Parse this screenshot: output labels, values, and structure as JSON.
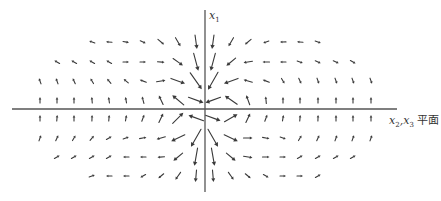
{
  "figure": {
    "colors": {
      "axis": "#555555",
      "arrow": "#3a3a3a",
      "background": "#ffffff"
    },
    "axes": {
      "vertical": {
        "x": 205,
        "y1": 10,
        "y2": 192
      },
      "horizontal": {
        "y": 109,
        "x1": 12,
        "x2": 397
      },
      "vertical_label": {
        "var": "x",
        "sub": "1",
        "x": 209,
        "y": 10
      },
      "horizontal_label": {
        "var1": "x",
        "sub1": "2",
        "sep": ",",
        "var2": "x",
        "sub2": "3",
        "suffix": "平面",
        "x": 389,
        "y": 115
      }
    },
    "columns_x": [
      40,
      57,
      74,
      92,
      109,
      126,
      143,
      161,
      178,
      196,
      213,
      231,
      248,
      266,
      283,
      300,
      318,
      336,
      353,
      371
    ],
    "rows": [
      {
        "y": 42,
        "start_col": 3,
        "angles": [
          200,
          185,
          10,
          25,
          40,
          60,
          82,
          98,
          120,
          140,
          160,
          178,
          185,
          20
        ],
        "lengths": [
          6,
          6,
          6,
          6,
          8,
          10,
          14,
          14,
          10,
          8,
          6,
          6,
          6,
          6
        ]
      },
      {
        "y": 62,
        "start_col": 1,
        "angles": [
          210,
          210,
          210,
          210,
          0,
          0,
          5,
          35,
          75,
          105,
          140,
          170,
          180,
          180,
          20,
          25,
          25,
          30
        ],
        "lengths": [
          6,
          6,
          6,
          6,
          6,
          6,
          7,
          12,
          18,
          18,
          12,
          9,
          7,
          6,
          6,
          6,
          6,
          6
        ]
      },
      {
        "y": 81,
        "start_col": 0,
        "angles": [
          250,
          250,
          245,
          240,
          230,
          220,
          200,
          350,
          20,
          55,
          120,
          160,
          195,
          200,
          60,
          65,
          70,
          70,
          70,
          70
        ],
        "lengths": [
          6,
          6,
          6,
          6,
          6,
          6,
          7,
          9,
          15,
          20,
          20,
          15,
          9,
          7,
          6,
          6,
          6,
          6,
          6,
          6
        ]
      },
      {
        "y": 100,
        "start_col": 0,
        "angles": [
          270,
          270,
          270,
          265,
          262,
          260,
          255,
          245,
          220,
          20,
          160,
          215,
          250,
          265,
          270,
          270,
          270,
          270,
          270,
          270
        ],
        "lengths": [
          6,
          6,
          6,
          6,
          6,
          6,
          7,
          10,
          15,
          16,
          16,
          15,
          10,
          7,
          6,
          6,
          6,
          6,
          6,
          6
        ]
      },
      {
        "y": 118,
        "start_col": 0,
        "angles": [
          270,
          275,
          270,
          272,
          275,
          280,
          290,
          295,
          315,
          200,
          20,
          330,
          295,
          290,
          280,
          275,
          272,
          270,
          270,
          270
        ],
        "lengths": [
          6,
          6,
          6,
          6,
          6,
          6,
          7,
          10,
          15,
          16,
          16,
          15,
          10,
          7,
          6,
          6,
          6,
          6,
          6,
          6
        ]
      },
      {
        "y": 138,
        "start_col": 0,
        "angles": [
          290,
          295,
          300,
          310,
          330,
          340,
          350,
          165,
          155,
          120,
          60,
          25,
          0,
          10,
          20,
          300,
          295,
          290,
          290,
          290
        ],
        "lengths": [
          6,
          6,
          6,
          6,
          6,
          6,
          7,
          9,
          15,
          20,
          20,
          15,
          9,
          7,
          6,
          6,
          6,
          6,
          6,
          6
        ]
      },
      {
        "y": 157,
        "start_col": 1,
        "angles": [
          330,
          330,
          330,
          330,
          180,
          180,
          175,
          140,
          100,
          80,
          40,
          10,
          0,
          0,
          330,
          330,
          330,
          330
        ],
        "lengths": [
          6,
          6,
          6,
          6,
          6,
          6,
          7,
          12,
          18,
          18,
          12,
          9,
          7,
          6,
          6,
          6,
          6,
          6
        ]
      },
      {
        "y": 176,
        "start_col": 3,
        "angles": [
          340,
          180,
          180,
          150,
          140,
          125,
          95,
          85,
          55,
          40,
          30,
          0,
          0,
          330
        ],
        "lengths": [
          6,
          6,
          6,
          6,
          7,
          9,
          12,
          12,
          9,
          7,
          6,
          6,
          6,
          6
        ]
      }
    ]
  }
}
